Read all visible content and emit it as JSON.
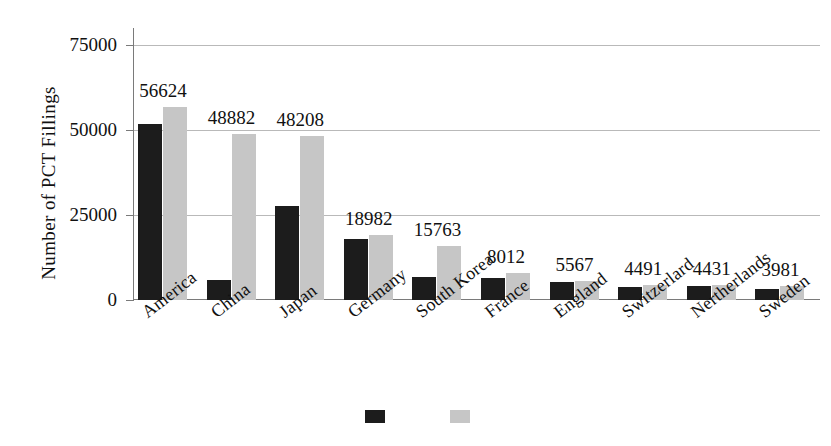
{
  "chart_data": {
    "type": "bar",
    "title": "",
    "xlabel": "",
    "ylabel": "Number of  PCT Fillings",
    "ylim": [
      0,
      75000
    ],
    "yticks": [
      0,
      25000,
      50000,
      75000
    ],
    "ytick_labels": [
      "0",
      "25000",
      "50000",
      "75000"
    ],
    "grid": true,
    "legend_position": "bottom",
    "categories": [
      "America",
      "China",
      "Japan",
      "Germany",
      "South Korea",
      "France",
      "England",
      "Switzerlard",
      "Nertherlands",
      "Sweden"
    ],
    "series": [
      {
        "name": "series-1",
        "color": "#1c1c1c",
        "values": [
          51800,
          5800,
          27700,
          17800,
          6900,
          6500,
          5400,
          3900,
          4100,
          3100
        ]
      },
      {
        "name": "series-2",
        "color": "#c6c6c6",
        "values": [
          56624,
          48882,
          48208,
          18982,
          15763,
          8012,
          5567,
          4491,
          4431,
          3981
        ]
      }
    ],
    "data_labels": [
      "56624",
      "48882",
      "48208",
      "18982",
      "15763",
      "8012",
      "5567",
      "4491",
      "4431",
      "3981"
    ],
    "annotations": []
  },
  "legend": {
    "items": [
      {
        "label": "",
        "color": "#1c1c1c"
      },
      {
        "label": "",
        "color": "#c6c6c6"
      }
    ]
  },
  "colors": {
    "dark_series": "#1c1c1c",
    "light_series": "#c6c6c6",
    "gridline": "#b9b9b9",
    "axis": "#7a7a7a",
    "text": "#111111",
    "background": "#ffffff"
  }
}
